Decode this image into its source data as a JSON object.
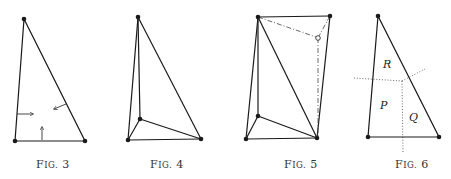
{
  "figures": [
    {
      "id": "fig3",
      "caption": "Fig. 3",
      "caption_small": "IG",
      "caption_num": "3"
    },
    {
      "id": "fig4",
      "caption": "Fig. 4",
      "caption_small": "IG",
      "caption_num": "4"
    },
    {
      "id": "fig5",
      "caption": "Fig. 5",
      "caption_small": "IG",
      "caption_num": "5"
    },
    {
      "id": "fig6",
      "caption": "Fig. 6",
      "caption_small": "IG",
      "caption_num": "6",
      "region_labels": {
        "R": "R",
        "P": "P",
        "Q": "Q"
      }
    }
  ],
  "colors": {
    "ink": "#1a1a1a",
    "background": "#ffffff",
    "caption": "#333333"
  }
}
